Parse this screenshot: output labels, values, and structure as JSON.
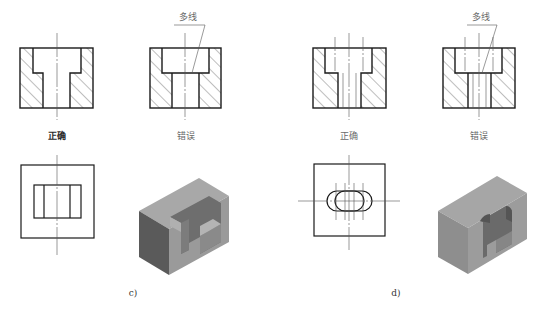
{
  "figure": {
    "panels": [
      {
        "id": "c",
        "caption": "c)",
        "sections": [
          {
            "verdict": "正确",
            "kind": "correct"
          },
          {
            "verdict": "错误",
            "kind": "wrong",
            "annotation": "多线"
          }
        ],
        "plan_view": "rectangular-counterbore",
        "iso_view": "rectangular-slot-block"
      },
      {
        "id": "d",
        "caption": "d)",
        "sections": [
          {
            "verdict": "正确",
            "kind": "correct"
          },
          {
            "verdict": "错误",
            "kind": "wrong",
            "annotation": "多线"
          }
        ],
        "plan_view": "obround-counterbore",
        "iso_view": "obround-slot-block"
      }
    ]
  },
  "colors": {
    "line": "#1a1a1a",
    "thin_line": "#555555",
    "hatch": "#444444",
    "iso_top": "#a8a8a8",
    "iso_front": "#5a5a5a",
    "iso_side": "#9a9a9a",
    "iso_inner": "#6e6e6e"
  }
}
